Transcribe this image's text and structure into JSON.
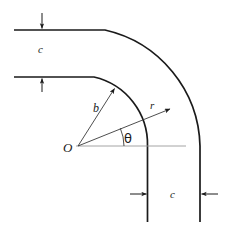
{
  "figure": {
    "type": "engineering-diagram",
    "width_px": 227,
    "height_px": 225,
    "background_color": "#ffffff",
    "stroke_color": "#1a1a1a",
    "guide_color": "#9a9a9a"
  },
  "labels": {
    "width_top": "c",
    "width_bottom": "c",
    "inner_radius": "b",
    "variable_radius": "r",
    "center": "O",
    "angle": "θ"
  },
  "geometry": {
    "center": {
      "x": 78,
      "y": 146
    },
    "inner_radius_px": 69,
    "outer_radius_px": 122,
    "duct_width_px": 53,
    "sweep_angle_deg": 90,
    "theta_ray_angle_deg": 35,
    "b_ray_angle_deg": 58,
    "outer_wall_top_y": 30,
    "inner_wall_top_y": 77,
    "inner_wall_right_x": 148,
    "outer_wall_right_x": 200,
    "straight_left_start_x": 14,
    "straight_bottom_end_y": 222,
    "horizontal_guide_end_x": 186
  },
  "annotations": {
    "top_dimension": {
      "label": "c",
      "arrow_x": 42,
      "upper_arrow_target_y": 30,
      "lower_arrow_target_y": 77,
      "direction": "vertical-inward"
    },
    "bottom_dimension": {
      "label": "c",
      "arrow_y": 194,
      "left_arrow_target_x": 148,
      "right_arrow_target_x": 200,
      "direction": "horizontal-inward"
    }
  }
}
